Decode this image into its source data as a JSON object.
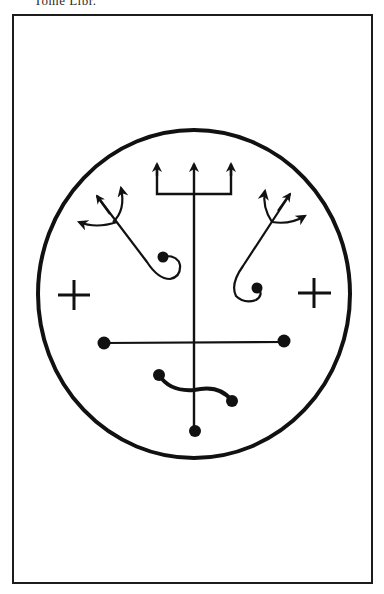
{
  "page": {
    "caption": "Tome Libr.",
    "background": "#ffffff",
    "ink_color": "#111111"
  },
  "seal": {
    "description": "Occult seal / sigil inside a rectangular frame",
    "elements": [
      "outer-circle",
      "central-trident",
      "left-trident-spiral",
      "right-trident-spiral",
      "left-cross",
      "right-cross",
      "horizontal-bar-with-dots",
      "s-curve-with-dots",
      "bottom-dot"
    ]
  }
}
